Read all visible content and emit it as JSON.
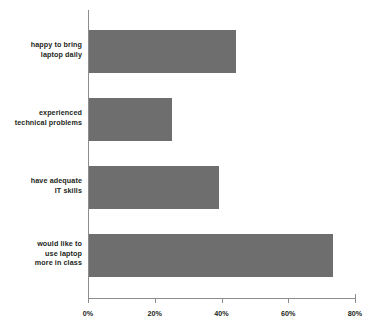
{
  "chart_data": {
    "type": "bar",
    "orientation": "horizontal",
    "title": "",
    "subtitle": "",
    "xlabel": "",
    "ylabel": "",
    "categories": [
      "happy to bring\nlaptop daily",
      "experienced\ntechnical problems",
      "have adequate\nIT skills",
      "would like to\nuse laptop\nmore in class"
    ],
    "category_lines": [
      [
        "happy to bring",
        "laptop daily"
      ],
      [
        "experienced",
        "technical problems"
      ],
      [
        "have adequate",
        "IT skills"
      ],
      [
        "would like to",
        "use laptop",
        "more in class"
      ]
    ],
    "values": [
      44,
      25,
      39,
      73
    ],
    "value_labels": [
      "44%",
      "25%",
      "39%",
      "73%"
    ],
    "xlim": [
      0,
      80
    ],
    "xticks": [
      0,
      20,
      40,
      60,
      80
    ],
    "xtick_labels": [
      "0%",
      "20%",
      "40%",
      "60%",
      "80%"
    ],
    "grid": false,
    "legend": null,
    "bar_color": "#6e6e6e",
    "axis_color": "#8c8c8c",
    "text_color": "#231f20",
    "background": "#ffffff"
  }
}
